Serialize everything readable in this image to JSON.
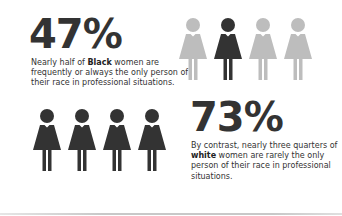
{
  "colors": {
    "dark_figure": "#333333",
    "light_figure": "#bdbdbd",
    "text": "#333333",
    "background": "#ffffff"
  },
  "black_women": {
    "stat": "47%",
    "description_pre": "Nearly half of ",
    "description_bold": "Black",
    "description_post": " women are frequently or always the only person of their race in professional situations.",
    "icon_row": [
      "light",
      "dark",
      "light",
      "light"
    ]
  },
  "white_women": {
    "stat": "73%",
    "description_pre": "By contrast, nearly three quarters of ",
    "description_bold": "white",
    "description_post": " women are rarely the only person of their race in professional situations.",
    "icon_row": [
      "dark",
      "dark",
      "dark",
      "dark"
    ]
  },
  "chart_data": {
    "type": "table",
    "title": "",
    "rows": [
      {
        "group": "Black women",
        "value": 47,
        "unit": "%",
        "label": "frequently or always the only person of their race in professional situations"
      },
      {
        "group": "white women",
        "value": 73,
        "unit": "%",
        "label": "rarely the only person of their race in professional situations"
      }
    ],
    "pictograms": [
      {
        "group": "Black women",
        "icons": 4,
        "highlighted": 1
      },
      {
        "group": "white women",
        "icons": 4,
        "highlighted": 4
      }
    ]
  }
}
